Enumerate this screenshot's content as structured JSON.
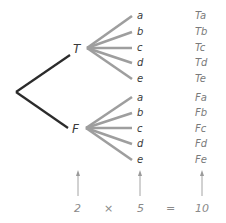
{
  "tree": {
    "level1": [
      {
        "label": "T",
        "x": 77,
        "y": 52
      },
      {
        "label": "F",
        "x": 76,
        "y": 132
      }
    ],
    "level2_labels": [
      "a",
      "b",
      "c",
      "d",
      "e"
    ],
    "level2_T": [
      {
        "label": "a",
        "y": 19
      },
      {
        "label": "b",
        "y": 35
      },
      {
        "label": "c",
        "y": 51
      },
      {
        "label": "d",
        "y": 66
      },
      {
        "label": "e",
        "y": 82
      }
    ],
    "level2_F": [
      {
        "label": "a",
        "y": 101
      },
      {
        "label": "b",
        "y": 116
      },
      {
        "label": "c",
        "y": 132
      },
      {
        "label": "d",
        "y": 147
      },
      {
        "label": "e",
        "y": 163
      }
    ],
    "outcomes": [
      "Ta",
      "Tb",
      "Tc",
      "Td",
      "Te",
      "Fa",
      "Fb",
      "Fc",
      "Fd",
      "Fe"
    ]
  },
  "equation": {
    "factor1": "2",
    "times": "×",
    "factor2": "5",
    "equals": "=",
    "product": "10"
  },
  "colors": {
    "root_branch": "#2b2b2b",
    "leaf_branch": "#9e9e9e",
    "label": "#3a3a3a",
    "outcome": "#7a7a7a",
    "arrow": "#9a9a9a",
    "equation": "#8a8a8a"
  }
}
